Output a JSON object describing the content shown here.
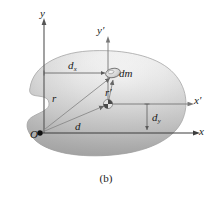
{
  "figure": {
    "caption": "(b)",
    "colors": {
      "body_light": "#f2f2f2",
      "body_mid": "#d9d9d9",
      "body_dark": "#a8a8a8",
      "axis": "#555555",
      "vector": "#7a7a7a",
      "text": "#1a1a1a",
      "background": "#ffffff"
    },
    "axes": {
      "y_label": "y",
      "y_prime_label": "y′",
      "x_label": "x",
      "x_prime_label": "x′",
      "origin_label": "O"
    },
    "annotations": {
      "dx_label": "d",
      "dx_sub": "x",
      "dy_label": "d",
      "dy_sub": "y",
      "d_label": "d",
      "r_label": "r",
      "r_prime_label": "r′",
      "dm_label": "dm"
    },
    "geometry": {
      "origin_x": 40,
      "origin_y": 133,
      "com_x": 108,
      "com_y": 104,
      "dm_x": 113,
      "dm_y": 74
    }
  }
}
